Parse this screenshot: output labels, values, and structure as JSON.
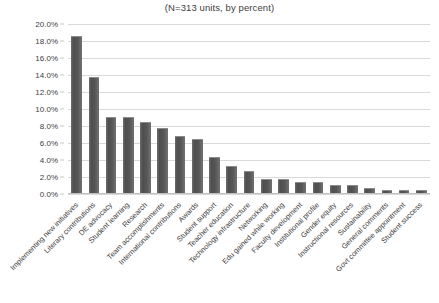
{
  "chart_data": {
    "type": "bar",
    "title": "(N=313 units, by percent)",
    "xlabel": "",
    "ylabel": "",
    "ylim": [
      0,
      20
    ],
    "ytick_labels": [
      "0.0%",
      "2.0%",
      "4.0%",
      "6.0%",
      "8.0%",
      "10.0%",
      "12.0%",
      "14.0%",
      "16.0%",
      "18.0%",
      "20.0%"
    ],
    "ytick_values": [
      0,
      2,
      4,
      6,
      8,
      10,
      12,
      14,
      16,
      18,
      20
    ],
    "grid": true,
    "legend": "none",
    "bar_color": "#575757",
    "categories": [
      "Implementing new initiatives",
      "Literary contributions",
      "DE advocacy",
      "Student learning",
      "Research",
      "Team accomplishments",
      "International contributions",
      "Awards",
      "Student support",
      "Teacher education",
      "Technology infrastructure",
      "Networking",
      "Edu gained while working",
      "Faculty development",
      "Institutional profile",
      "Gender equity",
      "Instructional resources",
      "Sustainability",
      "General comments",
      "Govt committee appointment",
      "Student success"
    ],
    "values": [
      18.5,
      13.7,
      9.0,
      9.0,
      8.3,
      7.7,
      6.7,
      6.4,
      4.2,
      3.2,
      2.6,
      1.6,
      1.6,
      1.3,
      1.3,
      1.0,
      1.0,
      0.6,
      0.3,
      0.3,
      0.3
    ],
    "value_labels": [
      "18.5%",
      "13.7%",
      "9.0%",
      "9.0%",
      "8.3%",
      "7.7%",
      "6.7%",
      "6.4%",
      "4.2%",
      "3.2%",
      "2.6%",
      "1.6%",
      "1.6%",
      "1.3%",
      "1.3%",
      "1.0%",
      "1.0%",
      "0.6%",
      "0.3%",
      "0.3%",
      "0.3%"
    ]
  }
}
